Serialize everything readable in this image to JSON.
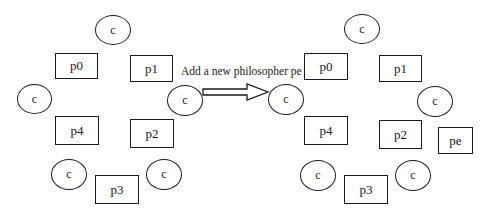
{
  "diagram": {
    "caption": "Add a new philosopher pe",
    "left": {
      "nodes": [
        {
          "id": "c-top",
          "label": "c",
          "shape": "circle",
          "x": 95,
          "y": 15,
          "w": 36,
          "h": 30
        },
        {
          "id": "p0",
          "label": "p0",
          "shape": "box",
          "x": 55,
          "y": 53,
          "w": 43,
          "h": 26
        },
        {
          "id": "p1",
          "label": "p1",
          "shape": "box",
          "x": 130,
          "y": 55,
          "w": 43,
          "h": 27
        },
        {
          "id": "c-left",
          "label": "c",
          "shape": "circle",
          "x": 17,
          "y": 84,
          "w": 35,
          "h": 30
        },
        {
          "id": "c-right",
          "label": "c",
          "shape": "circle",
          "x": 167,
          "y": 85,
          "w": 36,
          "h": 31
        },
        {
          "id": "p4",
          "label": "p4",
          "shape": "box",
          "x": 55,
          "y": 116,
          "w": 44,
          "h": 29
        },
        {
          "id": "p2",
          "label": "p2",
          "shape": "box",
          "x": 130,
          "y": 119,
          "w": 44,
          "h": 29
        },
        {
          "id": "c-bottom-left",
          "label": "c",
          "shape": "circle",
          "x": 51,
          "y": 159,
          "w": 36,
          "h": 31
        },
        {
          "id": "c-bottom-right",
          "label": "c",
          "shape": "circle",
          "x": 146,
          "y": 159,
          "w": 36,
          "h": 31
        },
        {
          "id": "p3",
          "label": "p3",
          "shape": "box",
          "x": 95,
          "y": 175,
          "w": 44,
          "h": 29
        }
      ]
    },
    "right": {
      "nodes": [
        {
          "id": "c-top",
          "label": "c",
          "shape": "circle",
          "x": 344,
          "y": 14,
          "w": 36,
          "h": 30
        },
        {
          "id": "p0",
          "label": "p0",
          "shape": "box",
          "x": 304,
          "y": 53,
          "w": 44,
          "h": 27
        },
        {
          "id": "p1",
          "label": "p1",
          "shape": "box",
          "x": 379,
          "y": 55,
          "w": 43,
          "h": 27
        },
        {
          "id": "c-left",
          "label": "c",
          "shape": "circle",
          "x": 268,
          "y": 84,
          "w": 36,
          "h": 31
        },
        {
          "id": "c-right",
          "label": "c",
          "shape": "circle",
          "x": 417,
          "y": 86,
          "w": 36,
          "h": 31
        },
        {
          "id": "p4",
          "label": "p4",
          "shape": "box",
          "x": 304,
          "y": 116,
          "w": 44,
          "h": 29
        },
        {
          "id": "p2",
          "label": "p2",
          "shape": "box",
          "x": 379,
          "y": 120,
          "w": 43,
          "h": 29
        },
        {
          "id": "pe",
          "label": "pe",
          "shape": "box",
          "x": 438,
          "y": 127,
          "w": 35,
          "h": 27
        },
        {
          "id": "c-bottom-left",
          "label": "c",
          "shape": "circle",
          "x": 300,
          "y": 160,
          "w": 36,
          "h": 31
        },
        {
          "id": "c-bottom-right",
          "label": "c",
          "shape": "circle",
          "x": 395,
          "y": 160,
          "w": 36,
          "h": 31
        },
        {
          "id": "p3",
          "label": "p3",
          "shape": "box",
          "x": 344,
          "y": 175,
          "w": 44,
          "h": 29
        }
      ]
    },
    "colors": {
      "stroke": "#1a1a1a",
      "background": "#ffffff"
    }
  }
}
